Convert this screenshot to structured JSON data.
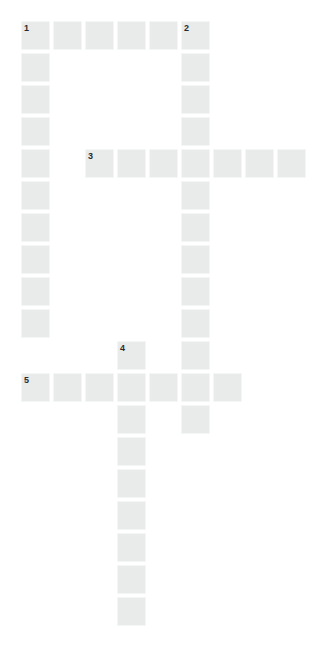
{
  "puzzle": {
    "title": "Crossword Grid",
    "type": "crossword-grid",
    "grid": {
      "origin_x": 21,
      "origin_y": 21,
      "cell_size": 29,
      "pitch": 32,
      "columns": 9,
      "rows": 19,
      "cell_color": "#e9eaea",
      "gap_color": "#ffffff",
      "background_color": "#ffffff",
      "number_color": "#2b2b2b"
    },
    "entries": [
      {
        "number": "1",
        "direction": "across",
        "row": 0,
        "col": 0,
        "length": 6,
        "label": "1-across"
      },
      {
        "number": "1",
        "direction": "down",
        "row": 0,
        "col": 0,
        "length": 10,
        "label": "1-down"
      },
      {
        "number": "2",
        "direction": "down",
        "row": 0,
        "col": 5,
        "length": 13,
        "label": "2-down"
      },
      {
        "number": "3",
        "direction": "across",
        "row": 4,
        "col": 2,
        "length": 7,
        "label": "3-across"
      },
      {
        "number": "4",
        "direction": "down",
        "row": 10,
        "col": 3,
        "length": 9,
        "label": "4-down"
      },
      {
        "number": "5",
        "direction": "across",
        "row": 11,
        "col": 0,
        "length": 7,
        "label": "5-across"
      }
    ],
    "numbered_cells": [
      {
        "number": "1",
        "row": 0,
        "col": 0
      },
      {
        "number": "2",
        "row": 0,
        "col": 5
      },
      {
        "number": "3",
        "row": 4,
        "col": 2
      },
      {
        "number": "4",
        "row": 10,
        "col": 3
      },
      {
        "number": "5",
        "row": 11,
        "col": 0
      }
    ],
    "cells": [
      {
        "row": 0,
        "col": 0,
        "letter": ""
      },
      {
        "row": 0,
        "col": 1,
        "letter": ""
      },
      {
        "row": 0,
        "col": 2,
        "letter": ""
      },
      {
        "row": 0,
        "col": 3,
        "letter": ""
      },
      {
        "row": 0,
        "col": 4,
        "letter": ""
      },
      {
        "row": 0,
        "col": 5,
        "letter": ""
      },
      {
        "row": 1,
        "col": 0,
        "letter": ""
      },
      {
        "row": 1,
        "col": 5,
        "letter": ""
      },
      {
        "row": 2,
        "col": 0,
        "letter": ""
      },
      {
        "row": 2,
        "col": 5,
        "letter": ""
      },
      {
        "row": 3,
        "col": 0,
        "letter": ""
      },
      {
        "row": 3,
        "col": 5,
        "letter": ""
      },
      {
        "row": 4,
        "col": 0,
        "letter": ""
      },
      {
        "row": 4,
        "col": 2,
        "letter": ""
      },
      {
        "row": 4,
        "col": 3,
        "letter": ""
      },
      {
        "row": 4,
        "col": 4,
        "letter": ""
      },
      {
        "row": 4,
        "col": 5,
        "letter": ""
      },
      {
        "row": 4,
        "col": 6,
        "letter": ""
      },
      {
        "row": 4,
        "col": 7,
        "letter": ""
      },
      {
        "row": 4,
        "col": 8,
        "letter": ""
      },
      {
        "row": 5,
        "col": 0,
        "letter": ""
      },
      {
        "row": 5,
        "col": 5,
        "letter": ""
      },
      {
        "row": 6,
        "col": 0,
        "letter": ""
      },
      {
        "row": 6,
        "col": 5,
        "letter": ""
      },
      {
        "row": 7,
        "col": 0,
        "letter": ""
      },
      {
        "row": 7,
        "col": 5,
        "letter": ""
      },
      {
        "row": 8,
        "col": 0,
        "letter": ""
      },
      {
        "row": 8,
        "col": 5,
        "letter": ""
      },
      {
        "row": 9,
        "col": 0,
        "letter": ""
      },
      {
        "row": 9,
        "col": 5,
        "letter": ""
      },
      {
        "row": 10,
        "col": 3,
        "letter": ""
      },
      {
        "row": 10,
        "col": 5,
        "letter": ""
      },
      {
        "row": 11,
        "col": 0,
        "letter": ""
      },
      {
        "row": 11,
        "col": 1,
        "letter": ""
      },
      {
        "row": 11,
        "col": 2,
        "letter": ""
      },
      {
        "row": 11,
        "col": 3,
        "letter": ""
      },
      {
        "row": 11,
        "col": 4,
        "letter": ""
      },
      {
        "row": 11,
        "col": 5,
        "letter": ""
      },
      {
        "row": 11,
        "col": 6,
        "letter": ""
      },
      {
        "row": 12,
        "col": 3,
        "letter": ""
      },
      {
        "row": 12,
        "col": 5,
        "letter": ""
      },
      {
        "row": 13,
        "col": 3,
        "letter": ""
      },
      {
        "row": 14,
        "col": 3,
        "letter": ""
      },
      {
        "row": 15,
        "col": 3,
        "letter": ""
      },
      {
        "row": 16,
        "col": 3,
        "letter": ""
      },
      {
        "row": 17,
        "col": 3,
        "letter": ""
      },
      {
        "row": 18,
        "col": 3,
        "letter": ""
      }
    ]
  }
}
